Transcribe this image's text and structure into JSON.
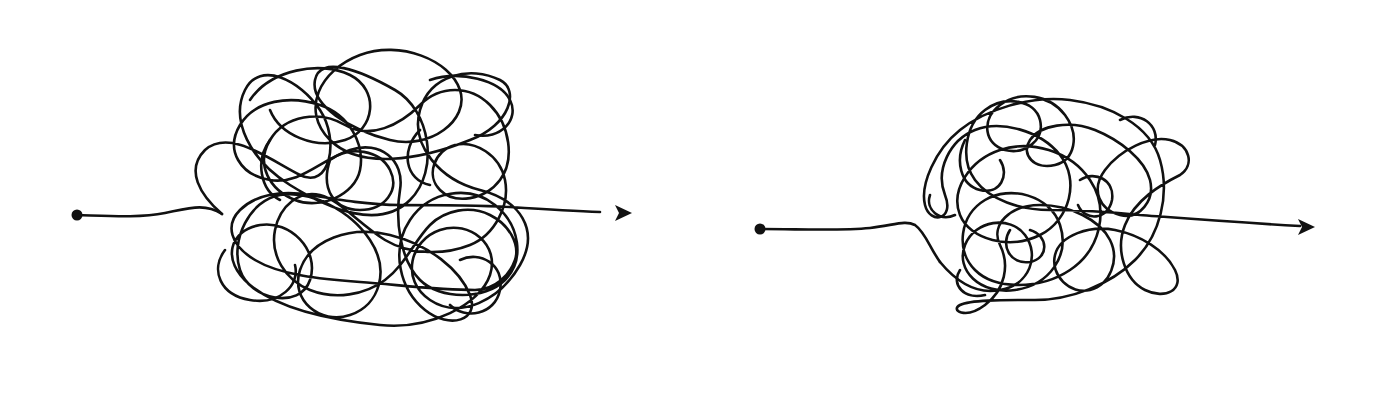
{
  "illustration": {
    "background": "#ffffff",
    "ink_color": "#111111",
    "figures": [
      {
        "name": "large-tangle",
        "start_point": [
          77,
          215
        ],
        "arrow_tip": [
          632,
          213
        ],
        "tangle_bounds": {
          "x": 190,
          "y": 45,
          "width": 350,
          "height": 285
        }
      },
      {
        "name": "small-tangle",
        "start_point": [
          760,
          229
        ],
        "arrow_tip": [
          1315,
          227
        ],
        "tangle_bounds": {
          "x": 922,
          "y": 80,
          "width": 270,
          "height": 232
        }
      }
    ]
  }
}
